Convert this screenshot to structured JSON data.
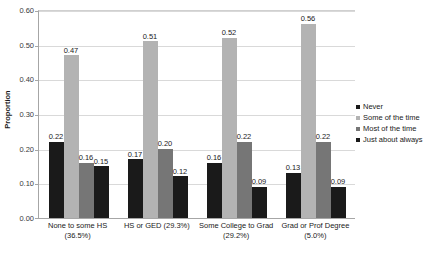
{
  "chart_data": {
    "type": "bar",
    "title": "",
    "xlabel": "",
    "ylabel": "Proportion",
    "ylim": [
      0.0,
      0.6
    ],
    "ytick_values": [
      0.6,
      0.5,
      0.4,
      0.3,
      0.2,
      0.1,
      0.0
    ],
    "ytick_labels": [
      "0.60",
      "0.50",
      "0.40",
      "0.30",
      "0.20",
      "0.10",
      "0.00"
    ],
    "grid": true,
    "legend_position": "right",
    "categories": [
      "None to some HS (36.5%)",
      "HS or GED (29.3%)",
      "Some College to Grad (29.2%)",
      "Grad or Prof Degree (5.0%)"
    ],
    "category_lines": [
      [
        "None to some HS",
        "(36.5%)"
      ],
      [
        "HS or GED (29.3%)",
        ""
      ],
      [
        "Some College to Grad",
        "(29.2%)"
      ],
      [
        "Grad or Prof Degree",
        "(5.0%)"
      ]
    ],
    "series": [
      {
        "name": "Never",
        "color": "#1a1a1a",
        "values": [
          0.22,
          0.17,
          0.16,
          0.13
        ],
        "labels": [
          "0.22",
          "0.17",
          "0.16",
          "0.13"
        ]
      },
      {
        "name": "Some of the time",
        "color": "#b3b3b3",
        "values": [
          0.47,
          0.51,
          0.52,
          0.56
        ],
        "labels": [
          "0.47",
          "0.51",
          "0.52",
          "0.56"
        ]
      },
      {
        "name": "Most of the time",
        "color": "#767676",
        "values": [
          0.16,
          0.2,
          0.22,
          0.22
        ],
        "labels": [
          "0.16",
          "0.20",
          "0.22",
          "0.22"
        ]
      },
      {
        "name": "Just about always",
        "color": "#1a1a1a",
        "values": [
          0.15,
          0.12,
          0.09,
          0.09
        ],
        "labels": [
          "0.15",
          "0.12",
          "0.09",
          "0.09"
        ]
      }
    ]
  },
  "axis": {
    "y_title": "Proportion"
  },
  "legend": {
    "items": [
      {
        "label": "Never",
        "color": "#1a1a1a"
      },
      {
        "label": "Some of the time",
        "color": "#b3b3b3"
      },
      {
        "label": "Most of the time",
        "color": "#767676"
      },
      {
        "label": "Just about always",
        "color": "#1a1a1a"
      }
    ]
  }
}
